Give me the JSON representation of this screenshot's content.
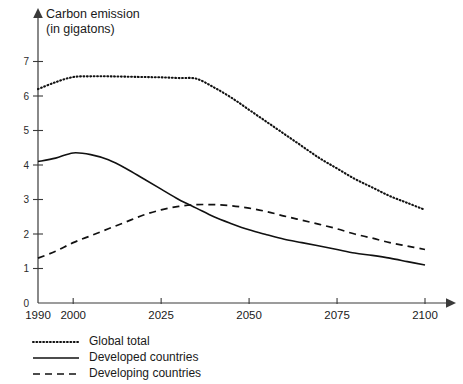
{
  "chart_data": {
    "type": "line",
    "title": "Carbon emission (in gigatons)",
    "title_line1": "Carbon emission",
    "title_line2": "(in gigatons)",
    "xlabel": "",
    "ylabel": "Carbon emission (in gigatons)",
    "xlim": [
      1990,
      2100
    ],
    "ylim": [
      0,
      7
    ],
    "grid": false,
    "legend_position": "bottom-left",
    "x_ticks": [
      1990,
      2000,
      2025,
      2050,
      2075,
      2100
    ],
    "x_tick_labels": [
      "1990",
      "2000",
      "2025",
      "2050",
      "2075",
      "2100"
    ],
    "y_ticks": [
      0,
      1,
      2,
      3,
      4,
      5,
      6,
      7
    ],
    "y_tick_labels": [
      "0",
      "1",
      "2",
      "3",
      "4",
      "5",
      "6",
      "7"
    ],
    "series": [
      {
        "name": "Global total",
        "style": "dotted",
        "color": "#111111",
        "x": [
          1990,
          1995,
          2000,
          2005,
          2010,
          2015,
          2020,
          2025,
          2030,
          2035,
          2040,
          2045,
          2050,
          2055,
          2060,
          2065,
          2070,
          2075,
          2080,
          2085,
          2090,
          2095,
          2100
        ],
        "values": [
          6.2,
          6.4,
          6.55,
          6.57,
          6.57,
          6.56,
          6.55,
          6.54,
          6.52,
          6.5,
          6.25,
          5.95,
          5.6,
          5.25,
          4.9,
          4.55,
          4.2,
          3.9,
          3.6,
          3.35,
          3.1,
          2.9,
          2.7
        ]
      },
      {
        "name": "Developed countries",
        "style": "solid",
        "color": "#111111",
        "x": [
          1990,
          1995,
          2000,
          2005,
          2010,
          2015,
          2020,
          2025,
          2030,
          2035,
          2040,
          2045,
          2050,
          2055,
          2060,
          2065,
          2070,
          2075,
          2080,
          2085,
          2090,
          2095,
          2100
        ],
        "values": [
          4.1,
          4.2,
          4.35,
          4.3,
          4.15,
          3.9,
          3.6,
          3.3,
          3.0,
          2.75,
          2.5,
          2.3,
          2.12,
          1.98,
          1.85,
          1.75,
          1.65,
          1.55,
          1.45,
          1.38,
          1.3,
          1.2,
          1.1
        ]
      },
      {
        "name": "Developing countries",
        "style": "dashed",
        "color": "#111111",
        "x": [
          1990,
          1995,
          2000,
          2005,
          2010,
          2015,
          2020,
          2025,
          2030,
          2035,
          2040,
          2045,
          2050,
          2055,
          2060,
          2065,
          2070,
          2075,
          2080,
          2085,
          2090,
          2095,
          2100
        ],
        "values": [
          1.3,
          1.5,
          1.75,
          1.95,
          2.15,
          2.35,
          2.55,
          2.7,
          2.8,
          2.85,
          2.85,
          2.82,
          2.75,
          2.65,
          2.52,
          2.4,
          2.28,
          2.15,
          2.0,
          1.88,
          1.75,
          1.65,
          1.55
        ]
      }
    ]
  },
  "legend": {
    "entries": [
      {
        "label": "Global total",
        "style": "dotted"
      },
      {
        "label": "Developed countries",
        "style": "solid"
      },
      {
        "label": "Developing countries",
        "style": "dashed"
      }
    ]
  }
}
